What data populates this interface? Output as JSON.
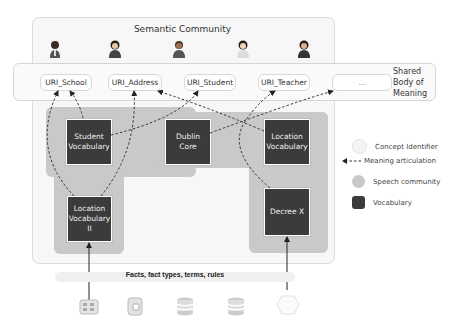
{
  "diagram": {
    "community_title": "Semantic Community",
    "shared_body_label_lines": [
      "Shared",
      "Body of",
      "Meaning"
    ],
    "people": [
      {
        "icon": "person-icon"
      },
      {
        "icon": "person-icon"
      },
      {
        "icon": "person-icon"
      },
      {
        "icon": "person-icon"
      },
      {
        "icon": "person-icon"
      }
    ],
    "concepts": [
      {
        "label": "URI_School"
      },
      {
        "label": "URI_Address"
      },
      {
        "label": "URI_Student"
      },
      {
        "label": "URI_Teacher"
      },
      {
        "label": "..."
      }
    ],
    "vocabularies": [
      {
        "lines": [
          "Student",
          "Vocabulary"
        ]
      },
      {
        "lines": [
          "Dublin",
          "Core"
        ]
      },
      {
        "lines": [
          "Location",
          "Vocabulary"
        ]
      },
      {
        "lines": [
          "Location",
          "Vocabulary",
          "II"
        ]
      },
      {
        "lines": [
          "Decree X"
        ]
      }
    ],
    "facts_label": "Facts, fact types, terms, rules",
    "sources": [
      {
        "icon": "server-rack-icon"
      },
      {
        "icon": "document-store-icon"
      },
      {
        "icon": "database-icon"
      },
      {
        "icon": "database-icon"
      },
      {
        "icon": "hexagon-source-icon"
      }
    ]
  },
  "legend": {
    "items": [
      {
        "label": "Concept Identifier",
        "color": "#f4f4f4"
      },
      {
        "label": "Meaning articulation",
        "color": "#333333"
      },
      {
        "label": "Speech community",
        "color": "#c9c9c9"
      },
      {
        "label": "Vocabulary",
        "color": "#3b3b3b"
      }
    ]
  }
}
